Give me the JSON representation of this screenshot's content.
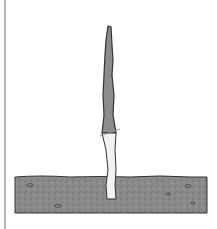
{
  "figure": {
    "colors": {
      "ground": "#8a8a8a",
      "stake_upper": "#8c8c8c",
      "stake_lower": "#f2f2f2",
      "outline": "#333333",
      "edge": "#b5b5b5"
    }
  }
}
